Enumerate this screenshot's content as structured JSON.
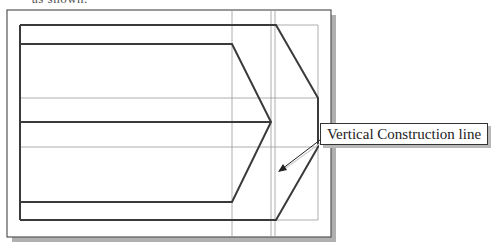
{
  "page": {
    "top_text": "as shown."
  },
  "drawing": {
    "frame": {
      "x": 7,
      "y": 10,
      "width": 324,
      "height": 227
    },
    "shadow_color": "#b0b0b0",
    "line_color": "#3a3a3a",
    "construction_color": "#9a9a9a",
    "construction_lines": {
      "vertical_x": [
        232,
        271,
        275,
        318
      ],
      "horizontal_y": [
        25,
        98,
        147,
        220
      ]
    },
    "outer_shape_points": "20,25 276,25 318,98 318,147 276,220 20,220",
    "inner_shape_points": "20,44 232,44 271,122 232,202 20,202",
    "middle_line": {
      "x1": 20,
      "y1": 122,
      "x2": 271,
      "y2": 122
    }
  },
  "callout": {
    "label": "Vertical Construction line",
    "arrow": {
      "from": [
        320,
        141
      ],
      "to": [
        279,
        172
      ]
    }
  }
}
